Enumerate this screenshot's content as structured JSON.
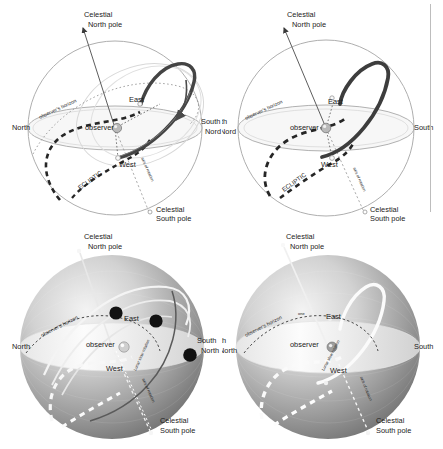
{
  "figure": {
    "layout": "2x2 grid of celestial-sphere panels; top row line art, bottom row shaded spheres",
    "background_color": "#ffffff",
    "ink_color": "#1b1b1b",
    "accent_dark": "#4a4a4a",
    "sphere_outline_color": "#9a9a9a",
    "divider_color": "#bdbdbd"
  },
  "panels": [
    {
      "id": "top-left",
      "style": "line-art",
      "labels": {
        "celestial_north_pole_l1": "Celestial",
        "celestial_north_pole_l2": "North pole",
        "celestial_south_pole_l1": "Celestial",
        "celestial_south_pole_l2": "South pole",
        "cardinal_left": "North",
        "cardinal_right_l1": "South",
        "cardinal_right_l2": "Nord",
        "east": "East",
        "west": "West",
        "observer": "observer",
        "observers_horizon": "observer's horizon",
        "ecliptic": "ECLIPTIC",
        "axis_of_rotation": "axis of rotation"
      }
    },
    {
      "id": "top-right",
      "style": "line-art",
      "labels": {
        "celestial_north_pole_l1": "Celestial",
        "celestial_north_pole_l2": "North pole",
        "celestial_south_pole_l1": "Celestial",
        "celestial_south_pole_l2": "South pole",
        "cardinal_left_l1": "th",
        "cardinal_left_l2": "Nord",
        "cardinal_right": "South",
        "east": "East",
        "west": "West",
        "observer": "observer",
        "observers_horizon": "observer's horizon",
        "ecliptic": "ECLIPTIC",
        "axis_of_rotation": "axis of rotation"
      }
    },
    {
      "id": "bottom-left",
      "style": "shaded-sphere",
      "labels": {
        "celestial_north_pole_l1": "Celestial",
        "celestial_north_pole_l2": "North pole",
        "celestial_south_pole_l1": "Celestial",
        "celestial_south_pole_l2": "South pole",
        "cardinal_left": "North",
        "cardinal_right_l1": "South",
        "cardinal_right_l2": "North",
        "east": "East",
        "west": "West",
        "observer": "observer",
        "observers_horizon": "observer's horizon",
        "lunar_slow_rotation": "Lunar slow rotation",
        "axis_of_rotation": "axis of rotation"
      },
      "moon_markers": 3
    },
    {
      "id": "bottom-right",
      "style": "shaded-sphere",
      "labels": {
        "celestial_north_pole_l1": "Celestial",
        "celestial_north_pole_l2": "North pole",
        "celestial_south_pole_l1": "Celestial",
        "celestial_south_pole_l2": "South pole",
        "cardinal_left_l1": "th",
        "cardinal_left_l2": "North",
        "cardinal_right": "South",
        "east": "East",
        "west": "West",
        "observer": "observer",
        "observers_horizon": "observer's horizon",
        "one": "one",
        "lunar_slow_rotation": "Lunar slow rotation",
        "axis_of_rotation": "axis of rotation"
      },
      "moon_markers": 0
    }
  ]
}
